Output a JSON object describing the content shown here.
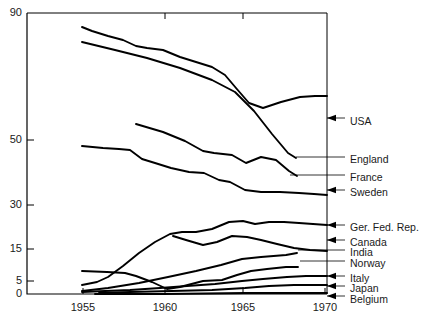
{
  "chart_data": {
    "type": "line",
    "title": "",
    "subtitle": "",
    "xlabel": "",
    "ylabel": "",
    "xlim": [
      1953.6,
      1970.1
    ],
    "ylim": [
      0,
      90
    ],
    "grid": false,
    "legend_position": "right-inline-labels",
    "y_scale": "compressed-nonlinear",
    "y_ticks": [
      {
        "value": 90,
        "label": "90",
        "py": 13
      },
      {
        "value": 50,
        "label": "50",
        "py": 140
      },
      {
        "value": 30,
        "label": "30",
        "py": 205
      },
      {
        "value": 15,
        "label": "15",
        "py": 249
      },
      {
        "value": 5,
        "label": "5",
        "py": 281
      },
      {
        "value": 0,
        "label": "0",
        "py": 294
      }
    ],
    "x_ticks": [
      {
        "value": 1955,
        "label": "1955",
        "px": 83
      },
      {
        "value": 1960,
        "label": "1960",
        "px": 165
      },
      {
        "value": 1965,
        "label": "1965",
        "px": 243
      },
      {
        "value": 1970,
        "label": "1970",
        "px": 325
      }
    ],
    "series": [
      {
        "name": "USA",
        "label": "USA",
        "label_px": 350,
        "label_py": 122,
        "leader_arrow": true,
        "leader_from_px": 345,
        "leader_to_px": 327,
        "leader_py": 118,
        "points": [
          {
            "x": 1955.0,
            "y": 87.0,
            "px": 82,
            "py": 27
          },
          {
            "x": 1955.6,
            "y": 85.0,
            "px": 92,
            "py": 31
          },
          {
            "x": 1956.6,
            "y": 82.5,
            "px": 108,
            "py": 36
          },
          {
            "x": 1957.5,
            "y": 80.5,
            "px": 123,
            "py": 40
          },
          {
            "x": 1958.3,
            "y": 77.5,
            "px": 136,
            "py": 46
          },
          {
            "x": 1959.0,
            "y": 76.5,
            "px": 147,
            "py": 48
          },
          {
            "x": 1960.0,
            "y": 75.5,
            "px": 163,
            "py": 50
          },
          {
            "x": 1961.0,
            "y": 72.0,
            "px": 180,
            "py": 57
          },
          {
            "x": 1962.0,
            "y": 69.5,
            "px": 196,
            "py": 62
          },
          {
            "x": 1963.0,
            "y": 67.0,
            "px": 212,
            "py": 67
          },
          {
            "x": 1963.8,
            "y": 63.5,
            "px": 225,
            "py": 75
          },
          {
            "x": 1964.5,
            "y": 58.0,
            "px": 236,
            "py": 88
          },
          {
            "x": 1965.3,
            "y": 52.5,
            "px": 249,
            "py": 103
          },
          {
            "x": 1966.2,
            "y": 51.0,
            "px": 263,
            "py": 108
          },
          {
            "x": 1967.3,
            "y": 53.0,
            "px": 281,
            "py": 102
          },
          {
            "x": 1968.5,
            "y": 55.5,
            "px": 300,
            "py": 97
          },
          {
            "x": 1969.4,
            "y": 56.5,
            "px": 315,
            "py": 96
          },
          {
            "x": 1970.0,
            "y": 56.5,
            "px": 327,
            "py": 96
          }
        ]
      },
      {
        "name": "England",
        "label": "England",
        "label_px": 350,
        "label_py": 160,
        "leader_arrow": false,
        "leader_from_px": 345,
        "leader_to_px": 296,
        "leader_py": 157,
        "points": [
          {
            "x": 1955.0,
            "y": 81.0,
            "px": 82,
            "py": 42
          },
          {
            "x": 1957.0,
            "y": 76.0,
            "px": 115,
            "py": 50
          },
          {
            "x": 1959.0,
            "y": 71.0,
            "px": 147,
            "py": 58
          },
          {
            "x": 1961.0,
            "y": 66.0,
            "px": 180,
            "py": 68
          },
          {
            "x": 1963.0,
            "y": 61.0,
            "px": 212,
            "py": 80
          },
          {
            "x": 1964.4,
            "y": 56.0,
            "px": 235,
            "py": 92
          },
          {
            "x": 1965.6,
            "y": 49.5,
            "px": 254,
            "py": 111
          },
          {
            "x": 1966.7,
            "y": 43.0,
            "px": 272,
            "py": 134
          },
          {
            "x": 1967.7,
            "y": 38.0,
            "px": 288,
            "py": 153
          },
          {
            "x": 1968.2,
            "y": 36.5,
            "px": 296,
            "py": 158
          }
        ]
      },
      {
        "name": "France",
        "label": "France",
        "label_px": 350,
        "label_py": 178,
        "leader_arrow": false,
        "leader_from_px": 345,
        "leader_to_px": 290,
        "leader_py": 175,
        "points": [
          {
            "x": 1958.3,
            "y": 52.5,
            "px": 136,
            "py": 124
          },
          {
            "x": 1960.0,
            "y": 50.0,
            "px": 163,
            "py": 132
          },
          {
            "x": 1961.3,
            "y": 47.0,
            "px": 185,
            "py": 141
          },
          {
            "x": 1962.4,
            "y": 44.0,
            "px": 203,
            "py": 151
          },
          {
            "x": 1963.1,
            "y": 43.5,
            "px": 214,
            "py": 153
          },
          {
            "x": 1964.2,
            "y": 43.0,
            "px": 232,
            "py": 155
          },
          {
            "x": 1965.1,
            "y": 40.5,
            "px": 246,
            "py": 163
          },
          {
            "x": 1966.0,
            "y": 42.5,
            "px": 261,
            "py": 157
          },
          {
            "x": 1966.9,
            "y": 41.5,
            "px": 276,
            "py": 160
          },
          {
            "x": 1967.7,
            "y": 38.5,
            "px": 289,
            "py": 171
          },
          {
            "x": 1968.3,
            "y": 37.0,
            "px": 297,
            "py": 176
          }
        ]
      },
      {
        "name": "Sweden",
        "label": "Sweden",
        "label_px": 350,
        "label_py": 193,
        "leader_arrow": true,
        "leader_from_px": 345,
        "leader_to_px": 327,
        "leader_py": 190,
        "points": [
          {
            "x": 1955.0,
            "y": 47.5,
            "px": 82,
            "py": 146
          },
          {
            "x": 1956.3,
            "y": 47.0,
            "px": 103,
            "py": 148
          },
          {
            "x": 1957.3,
            "y": 46.5,
            "px": 119,
            "py": 149
          },
          {
            "x": 1958.0,
            "y": 46.5,
            "px": 130,
            "py": 150
          },
          {
            "x": 1958.7,
            "y": 44.0,
            "px": 142,
            "py": 159
          },
          {
            "x": 1959.5,
            "y": 43.0,
            "px": 155,
            "py": 163
          },
          {
            "x": 1960.5,
            "y": 42.0,
            "px": 171,
            "py": 168
          },
          {
            "x": 1961.6,
            "y": 41.0,
            "px": 189,
            "py": 172
          },
          {
            "x": 1962.5,
            "y": 41.0,
            "px": 204,
            "py": 173
          },
          {
            "x": 1963.4,
            "y": 39.0,
            "px": 219,
            "py": 180
          },
          {
            "x": 1964.1,
            "y": 38.5,
            "px": 230,
            "py": 182
          },
          {
            "x": 1965.0,
            "y": 36.0,
            "px": 245,
            "py": 190
          },
          {
            "x": 1966.0,
            "y": 35.5,
            "px": 261,
            "py": 192
          },
          {
            "x": 1967.2,
            "y": 35.5,
            "px": 280,
            "py": 192
          },
          {
            "x": 1968.4,
            "y": 35.0,
            "px": 299,
            "py": 193
          },
          {
            "x": 1969.3,
            "y": 34.5,
            "px": 314,
            "py": 194
          },
          {
            "x": 1970.0,
            "y": 34.0,
            "px": 327,
            "py": 195
          }
        ]
      },
      {
        "name": "Ger. Fed. Rep.",
        "label": "Ger. Fed. Rep.",
        "label_px": 350,
        "label_py": 228,
        "leader_arrow": true,
        "leader_from_px": 345,
        "leader_to_px": 327,
        "leader_py": 225,
        "points": [
          {
            "x": 1955.0,
            "y": 4.2,
            "px": 82,
            "py": 285
          },
          {
            "x": 1955.9,
            "y": 5.0,
            "px": 97,
            "py": 282
          },
          {
            "x": 1956.6,
            "y": 6.5,
            "px": 108,
            "py": 277
          },
          {
            "x": 1957.5,
            "y": 10.0,
            "px": 123,
            "py": 266
          },
          {
            "x": 1958.5,
            "y": 14.0,
            "px": 139,
            "py": 253
          },
          {
            "x": 1959.5,
            "y": 18.0,
            "px": 155,
            "py": 242
          },
          {
            "x": 1960.4,
            "y": 21.0,
            "px": 170,
            "py": 234
          },
          {
            "x": 1961.1,
            "y": 21.5,
            "px": 182,
            "py": 232
          },
          {
            "x": 1962.0,
            "y": 21.5,
            "px": 196,
            "py": 232
          },
          {
            "x": 1963.0,
            "y": 22.5,
            "px": 212,
            "py": 229
          },
          {
            "x": 1964.0,
            "y": 24.5,
            "px": 229,
            "py": 222
          },
          {
            "x": 1964.9,
            "y": 25.0,
            "px": 243,
            "py": 221
          },
          {
            "x": 1965.6,
            "y": 24.0,
            "px": 255,
            "py": 224
          },
          {
            "x": 1966.5,
            "y": 24.5,
            "px": 269,
            "py": 222
          },
          {
            "x": 1967.4,
            "y": 24.5,
            "px": 284,
            "py": 222
          },
          {
            "x": 1968.4,
            "y": 24.0,
            "px": 299,
            "py": 223
          },
          {
            "x": 1969.2,
            "y": 24.0,
            "px": 313,
            "py": 224
          },
          {
            "x": 1970.0,
            "y": 23.5,
            "px": 327,
            "py": 225
          }
        ]
      },
      {
        "name": "Canada",
        "label": "Canada",
        "label_px": 350,
        "label_py": 243,
        "leader_arrow": true,
        "leader_from_px": 345,
        "leader_to_px": 327,
        "leader_py": 240,
        "points": [
          {
            "x": 1960.6,
            "y": 20.5,
            "px": 173,
            "py": 236
          },
          {
            "x": 1961.4,
            "y": 19.0,
            "px": 186,
            "py": 240
          },
          {
            "x": 1962.4,
            "y": 17.5,
            "px": 203,
            "py": 245
          },
          {
            "x": 1963.3,
            "y": 18.5,
            "px": 217,
            "py": 242
          },
          {
            "x": 1964.2,
            "y": 20.5,
            "px": 232,
            "py": 236
          },
          {
            "x": 1965.1,
            "y": 20.0,
            "px": 247,
            "py": 237
          },
          {
            "x": 1966.0,
            "y": 19.0,
            "px": 261,
            "py": 240
          },
          {
            "x": 1967.0,
            "y": 18.0,
            "px": 277,
            "py": 244
          },
          {
            "x": 1968.0,
            "y": 16.5,
            "px": 294,
            "py": 248
          },
          {
            "x": 1969.0,
            "y": 15.5,
            "px": 310,
            "py": 250
          },
          {
            "x": 1970.0,
            "y": 15.0,
            "px": 327,
            "py": 251
          }
        ]
      },
      {
        "name": "India",
        "label": "India",
        "label_px": 350,
        "label_py": 253,
        "leader_arrow": false,
        "leader_from_px": 345,
        "leader_to_px": 298,
        "leader_py": 250,
        "points": [
          {
            "x": 1955.0,
            "y": 2.0,
            "px": 82,
            "py": 291
          },
          {
            "x": 1956.6,
            "y": 2.8,
            "px": 108,
            "py": 288
          },
          {
            "x": 1958.5,
            "y": 4.5,
            "px": 139,
            "py": 283
          },
          {
            "x": 1960.3,
            "y": 6.5,
            "px": 168,
            "py": 277
          },
          {
            "x": 1962.0,
            "y": 8.5,
            "px": 196,
            "py": 271
          },
          {
            "x": 1963.5,
            "y": 10.5,
            "px": 221,
            "py": 265
          },
          {
            "x": 1964.8,
            "y": 12.5,
            "px": 242,
            "py": 259
          },
          {
            "x": 1966.0,
            "y": 13.0,
            "px": 261,
            "py": 257
          },
          {
            "x": 1967.5,
            "y": 13.5,
            "px": 286,
            "py": 255
          },
          {
            "x": 1968.2,
            "y": 14.0,
            "px": 297,
            "py": 253
          }
        ]
      },
      {
        "name": "Norway",
        "label": "Norway",
        "label_px": 350,
        "label_py": 264,
        "leader_arrow": false,
        "leader_from_px": 345,
        "leader_to_px": 300,
        "leader_py": 261,
        "points": [
          {
            "x": 1955.0,
            "y": 8.5,
            "px": 82,
            "py": 271
          },
          {
            "x": 1956.5,
            "y": 8.3,
            "px": 107,
            "py": 272
          },
          {
            "x": 1957.6,
            "y": 8.0,
            "px": 125,
            "py": 273
          },
          {
            "x": 1958.3,
            "y": 7.0,
            "px": 136,
            "py": 276
          },
          {
            "x": 1959.3,
            "y": 5.0,
            "px": 152,
            "py": 282
          },
          {
            "x": 1960.2,
            "y": 3.0,
            "px": 167,
            "py": 289
          },
          {
            "x": 1961.0,
            "y": 3.5,
            "px": 180,
            "py": 287
          },
          {
            "x": 1962.4,
            "y": 5.5,
            "px": 203,
            "py": 281
          },
          {
            "x": 1963.6,
            "y": 6.0,
            "px": 222,
            "py": 280
          },
          {
            "x": 1964.5,
            "y": 7.5,
            "px": 237,
            "py": 275
          },
          {
            "x": 1965.4,
            "y": 8.5,
            "px": 251,
            "py": 271
          },
          {
            "x": 1966.4,
            "y": 9.0,
            "px": 267,
            "py": 269
          },
          {
            "x": 1967.5,
            "y": 9.5,
            "px": 286,
            "py": 267
          },
          {
            "x": 1968.3,
            "y": 9.5,
            "px": 298,
            "py": 267
          }
        ]
      },
      {
        "name": "Italy",
        "label": "Italy",
        "label_px": 350,
        "label_py": 279,
        "leader_arrow": true,
        "leader_from_px": 345,
        "leader_to_px": 327,
        "leader_py": 276,
        "points": [
          {
            "x": 1955.0,
            "y": 1.3,
            "px": 82,
            "py": 292
          },
          {
            "x": 1956.4,
            "y": 1.6,
            "px": 105,
            "py": 291
          },
          {
            "x": 1958.0,
            "y": 2.2,
            "px": 130,
            "py": 290
          },
          {
            "x": 1959.8,
            "y": 3.0,
            "px": 160,
            "py": 288
          },
          {
            "x": 1961.5,
            "y": 3.8,
            "px": 187,
            "py": 286
          },
          {
            "x": 1963.2,
            "y": 4.5,
            "px": 215,
            "py": 284
          },
          {
            "x": 1964.8,
            "y": 5.2,
            "px": 242,
            "py": 281
          },
          {
            "x": 1966.2,
            "y": 6.0,
            "px": 263,
            "py": 279
          },
          {
            "x": 1967.6,
            "y": 6.5,
            "px": 287,
            "py": 277
          },
          {
            "x": 1968.8,
            "y": 7.0,
            "px": 306,
            "py": 276
          },
          {
            "x": 1970.0,
            "y": 7.0,
            "px": 327,
            "py": 276
          }
        ]
      },
      {
        "name": "Japan",
        "label": "Japan",
        "label_px": 350,
        "label_py": 289,
        "leader_arrow": true,
        "leader_from_px": 345,
        "leader_to_px": 327,
        "leader_py": 286,
        "points": [
          {
            "x": 1956.0,
            "y": 0.5,
            "px": 99,
            "py": 293
          },
          {
            "x": 1958.0,
            "y": 1.0,
            "px": 130,
            "py": 292
          },
          {
            "x": 1960.5,
            "y": 1.8,
            "px": 172,
            "py": 291
          },
          {
            "x": 1963.0,
            "y": 2.5,
            "px": 212,
            "py": 290
          },
          {
            "x": 1965.0,
            "y": 3.2,
            "px": 245,
            "py": 288
          },
          {
            "x": 1966.5,
            "y": 4.0,
            "px": 269,
            "py": 286
          },
          {
            "x": 1968.0,
            "y": 4.5,
            "px": 294,
            "py": 285
          },
          {
            "x": 1969.0,
            "y": 4.8,
            "px": 310,
            "py": 285
          },
          {
            "x": 1970.0,
            "y": 4.8,
            "px": 327,
            "py": 285
          }
        ]
      },
      {
        "name": "Belgium",
        "label": "Belgium",
        "label_px": 350,
        "label_py": 300,
        "leader_arrow": true,
        "leader_from_px": 345,
        "leader_to_px": 327,
        "leader_py": 296,
        "points": [
          {
            "x": 1955.8,
            "y": 0.2,
            "px": 95,
            "py": 294
          },
          {
            "x": 1960.0,
            "y": 0.4,
            "px": 163,
            "py": 294
          },
          {
            "x": 1965.0,
            "y": 0.6,
            "px": 245,
            "py": 293
          },
          {
            "x": 1970.0,
            "y": 0.8,
            "px": 327,
            "py": 293
          }
        ]
      }
    ]
  },
  "style": {
    "line_color": "#000000",
    "axis_color": "#000000",
    "leader_color": "#000000",
    "text_color": "#1a1a1a",
    "background": "#ffffff"
  },
  "axes": {
    "plot_left_px": 27,
    "plot_right_px": 327,
    "plot_top_px": 13,
    "plot_bottom_px": 294
  }
}
